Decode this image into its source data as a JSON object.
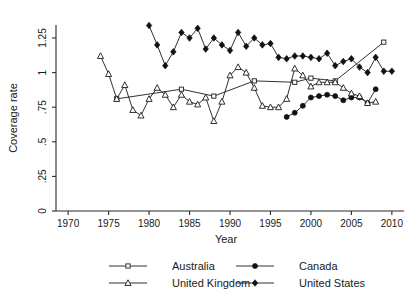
{
  "chart_data": {
    "type": "line",
    "title": "",
    "xlabel": "Year",
    "ylabel": "Coverage rate",
    "xlim": [
      1968.5,
      2011.5
    ],
    "ylim": [
      0,
      1.38
    ],
    "grid": false,
    "legend_position": "bottom",
    "xticks": [
      1970,
      1975,
      1980,
      1985,
      1990,
      1995,
      2000,
      2005,
      2010
    ],
    "xtick_labels": [
      "1970",
      "1975",
      "1980",
      "1985",
      "1990",
      "1995",
      "2000",
      "2005",
      "2010"
    ],
    "yticks": [
      0,
      0.25,
      0.5,
      0.75,
      1,
      1.25
    ],
    "ytick_labels": [
      "0",
      ".25",
      ".5",
      ".75",
      "1",
      "1.25"
    ],
    "series": [
      {
        "name": "Australia",
        "marker": "open-square",
        "x": [
          1976,
          1984,
          1988,
          1993,
          1998,
          2000,
          2003,
          2009
        ],
        "values": [
          0.81,
          0.88,
          0.83,
          0.94,
          0.93,
          0.96,
          0.94,
          1.22
        ]
      },
      {
        "name": "Canada",
        "marker": "filled-circle",
        "x": [
          1997,
          1998,
          1999,
          2000,
          2001,
          2002,
          2003,
          2004,
          2005,
          2006,
          2007,
          2008
        ],
        "values": [
          0.68,
          0.71,
          0.76,
          0.82,
          0.83,
          0.84,
          0.83,
          0.8,
          0.82,
          0.82,
          0.78,
          0.88
        ]
      },
      {
        "name": "United Kingdom",
        "marker": "open-triangle",
        "x": [
          1974,
          1975,
          1976,
          1977,
          1978,
          1979,
          1980,
          1981,
          1982,
          1983,
          1984,
          1985,
          1986,
          1987,
          1988,
          1989,
          1990,
          1991,
          1992,
          1993,
          1994,
          1995,
          1996,
          1997,
          1998,
          1999,
          2000,
          2001,
          2002,
          2003,
          2004,
          2005,
          2006,
          2007,
          2008
        ],
        "values": [
          1.12,
          0.99,
          0.81,
          0.91,
          0.73,
          0.69,
          0.81,
          0.89,
          0.84,
          0.75,
          0.84,
          0.79,
          0.77,
          0.82,
          0.65,
          0.79,
          0.98,
          1.04,
          1.0,
          0.89,
          0.76,
          0.75,
          0.75,
          0.81,
          1.03,
          0.98,
          0.9,
          0.93,
          0.93,
          0.93,
          0.89,
          0.85,
          0.83,
          0.78,
          0.79
        ]
      },
      {
        "name": "United States",
        "marker": "filled-diamond",
        "x": [
          1980,
          1981,
          1982,
          1983,
          1984,
          1985,
          1986,
          1987,
          1988,
          1989,
          1990,
          1991,
          1992,
          1993,
          1994,
          1995,
          1996,
          1997,
          1998,
          1999,
          2000,
          2001,
          2002,
          2003,
          2004,
          2005,
          2006,
          2007,
          2008,
          2009,
          2010
        ],
        "values": [
          1.34,
          1.2,
          1.05,
          1.15,
          1.29,
          1.25,
          1.32,
          1.17,
          1.25,
          1.2,
          1.16,
          1.29,
          1.19,
          1.25,
          1.2,
          1.21,
          1.11,
          1.1,
          1.12,
          1.12,
          1.11,
          1.1,
          1.14,
          1.05,
          1.08,
          1.1,
          1.04,
          1.0,
          1.11,
          1.01,
          1.01
        ]
      }
    ]
  },
  "legend": {
    "items": [
      {
        "label": "Australia",
        "marker": "open-square"
      },
      {
        "label": "Canada",
        "marker": "filled-circle"
      },
      {
        "label": "United Kingdom",
        "marker": "open-triangle"
      },
      {
        "label": "United States",
        "marker": "filled-diamond"
      }
    ]
  }
}
